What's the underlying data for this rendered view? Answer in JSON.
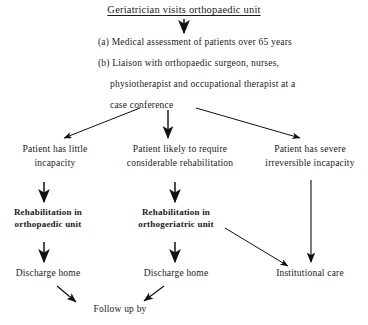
{
  "diagram": {
    "title": "Geriatrician visits orthopaedic unit",
    "steps": [
      "(a) Medical assessment of patients over 65 years",
      "(b) Liaison with orthopaedic surgeon, nurses,",
      "physiotherapist and occupational therapist at a",
      "case conference"
    ],
    "branches": [
      {
        "label": "Patient has little\nincapacity"
      },
      {
        "label": "Patient likely to require\nconsiderable rehabilitation"
      },
      {
        "label": "Patient has severe\nirreversible incapacity"
      }
    ],
    "treatments": [
      {
        "label": "Rehabilitation in\northopaedic unit"
      },
      {
        "label": "Rehabilitation in\northogeriatric unit"
      }
    ],
    "outcomes": [
      {
        "label": "Discharge home"
      },
      {
        "label": "Discharge home"
      },
      {
        "label": "Institutional care"
      }
    ],
    "footer": "Follow up by",
    "colors": {
      "ink": "#1a1a1a",
      "arrow": "#111111",
      "background": "#ffffff"
    }
  }
}
